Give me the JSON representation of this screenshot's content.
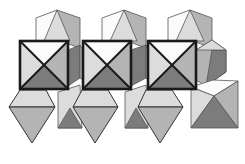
{
  "figure": {
    "colors": {
      "white": "#fbfbfb",
      "light": "#dcdcdc",
      "mid": "#b4b4b4",
      "dark": "#7c7c7c",
      "outline": "#1a1a1a"
    },
    "background_octahedra": [
      {
        "id": "top-1",
        "faces": [
          {
            "pts": "36,18 57,10 57,40 36,48",
            "fill": "white"
          },
          {
            "pts": "57,10 80,18 80,48 57,40",
            "fill": "mid"
          },
          {
            "pts": "57,10 44,41 70,41",
            "fill": "light"
          }
        ]
      },
      {
        "id": "top-2",
        "faces": [
          {
            "pts": "102,18 124,10 124,40 102,48",
            "fill": "white"
          },
          {
            "pts": "124,10 146,18 146,48 124,40",
            "fill": "mid"
          },
          {
            "pts": "124,10 110,41 137,41",
            "fill": "light"
          }
        ]
      },
      {
        "id": "top-3",
        "faces": [
          {
            "pts": "168,18 190,10 190,40 168,48",
            "fill": "white"
          },
          {
            "pts": "190,10 212,18 212,48 190,40",
            "fill": "mid"
          },
          {
            "pts": "190,10 176,41 204,41",
            "fill": "light"
          }
        ]
      },
      {
        "id": "mid-right-1",
        "faces": [
          {
            "pts": "68,50 80,45 80,78 68,86",
            "fill": "dark"
          },
          {
            "pts": "80,45 83,50 83,80 80,78",
            "fill": "mid"
          }
        ]
      },
      {
        "id": "mid-right-2",
        "faces": [
          {
            "pts": "131,50 146,45 146,78 131,86",
            "fill": "dark"
          },
          {
            "pts": "146,45 148,50 148,80 146,78",
            "fill": "mid"
          }
        ]
      },
      {
        "id": "mid-right-3",
        "faces": [
          {
            "pts": "196,50 212,40 226,50 226,72 206,86 196,80",
            "fill": "mid"
          },
          {
            "pts": "212,50 226,50 226,72 206,86",
            "fill": "dark"
          },
          {
            "pts": "196,50 212,40 226,50",
            "fill": "light"
          }
        ]
      },
      {
        "id": "bottom-cube-1",
        "faces": [
          {
            "pts": "58,92 80,85 82,128 58,128",
            "fill": "light"
          },
          {
            "pts": "58,128 70,108 82,128",
            "fill": "dark"
          }
        ]
      },
      {
        "id": "bottom-cube-2",
        "faces": [
          {
            "pts": "125,92 146,85 148,128 125,128",
            "fill": "light"
          },
          {
            "pts": "125,128 136,108 148,128",
            "fill": "dark"
          }
        ]
      },
      {
        "id": "bottom-right",
        "faces": [
          {
            "pts": "191,87 213,80 238,81 214,96",
            "fill": "white"
          },
          {
            "pts": "191,87 214,96 191,128",
            "fill": "light"
          },
          {
            "pts": "238,81 238,128 214,96",
            "fill": "mid"
          },
          {
            "pts": "191,128 214,96 238,128",
            "fill": "dark"
          }
        ]
      }
    ],
    "lower_octahedra": [
      {
        "id": "low-1",
        "top": "20,90 46,90 55,107 9,107",
        "bottom": "9,107 55,107 32,143"
      },
      {
        "id": "low-2",
        "top": "82,90 108,90 118,107 73,107",
        "bottom": "73,107 118,107 95,143"
      },
      {
        "id": "low-3",
        "top": "146,90 172,90 183,107 138,107",
        "bottom": "138,107 183,107 160,143"
      }
    ],
    "apex_octahedra": [
      {
        "id": "apex-1",
        "x": 20,
        "y": 41,
        "w": 48,
        "h": 48
      },
      {
        "id": "apex-2",
        "x": 83,
        "y": 41,
        "w": 48,
        "h": 48
      },
      {
        "id": "apex-3",
        "x": 148,
        "y": 41,
        "w": 48,
        "h": 48
      }
    ]
  }
}
